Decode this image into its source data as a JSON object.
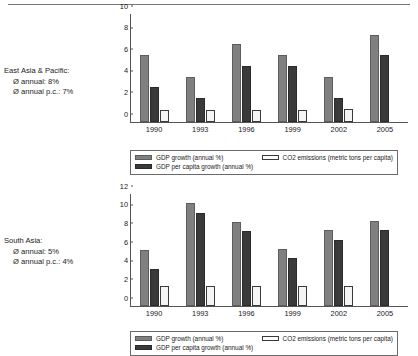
{
  "page": {
    "background": "#ffffff",
    "truncated_heading": ""
  },
  "colors": {
    "gdp_growth": "#808080",
    "gdp_per_capita_growth": "#3a3a3a",
    "co2_emissions": "#f4f4f4",
    "axis": "#555555",
    "text": "#1a1a1a"
  },
  "charts": [
    {
      "id": "east-asia-pacific",
      "caption": {
        "region": "East Asia & Pacific:",
        "annual": "Ø annual: 8%",
        "annual_pc": "Ø annual p.c.: 7%"
      },
      "yticks": [
        "10",
        "8",
        "6",
        "4",
        "2",
        "0"
      ],
      "xticks": [
        "1990",
        "1993",
        "1996",
        "1999",
        "2002",
        "2005"
      ],
      "legend": {
        "gdp_growth": "GDP growth (annual %)",
        "gdp_per_capita_growth": "GDP per capita growth (annual %)",
        "co2_emissions": "CO2 emissions (metric tons per capita)"
      },
      "chart_data": {
        "type": "bar",
        "title": "East Asia & Pacific",
        "xlabel": "",
        "ylabel": "",
        "ylim": [
          0,
          10
        ],
        "yticks": [
          0,
          2,
          4,
          6,
          8,
          10
        ],
        "grid": false,
        "legend_position": "bottom",
        "categories": [
          "1990",
          "1993",
          "1996",
          "1999",
          "2002",
          "2005"
        ],
        "series": [
          {
            "name": "GDP growth (annual %)",
            "values": [
              6.2,
              4.2,
              7.2,
              6.2,
              4.2,
              8.1
            ]
          },
          {
            "name": "GDP per capita growth (annual %)",
            "values": [
              3.2,
              2.2,
              5.2,
              5.2,
              2.2,
              6.2
            ]
          },
          {
            "name": "CO2 emissions (metric tons per capita)",
            "values": [
              1.1,
              1.1,
              1.1,
              1.1,
              1.2,
              null
            ]
          }
        ],
        "annotations": [
          "Ø annual: 8%",
          "Ø annual p.c.: 7%"
        ]
      }
    },
    {
      "id": "south-asia",
      "caption": {
        "region": "South Asia:",
        "annual": "Ø annual: 5%",
        "annual_pc": "Ø annual p.c.: 4%"
      },
      "yticks": [
        "12",
        "10",
        "8",
        "6",
        "4",
        "2",
        "0"
      ],
      "xticks": [
        "1990",
        "1993",
        "1996",
        "1999",
        "2002",
        "2005"
      ],
      "legend": {
        "gdp_growth": "GDP growth (annual %)",
        "gdp_per_capita_growth": "GDP per capita growth (annual %)",
        "co2_emissions": "CO2 emissions (metric tons per capita)"
      },
      "chart_data": {
        "type": "bar",
        "title": "South Asia",
        "xlabel": "",
        "ylabel": "",
        "ylim": [
          0,
          12
        ],
        "yticks": [
          0,
          2,
          4,
          6,
          8,
          10,
          12
        ],
        "grid": false,
        "legend_position": "bottom",
        "categories": [
          "1990",
          "1993",
          "1996",
          "1999",
          "2002",
          "2005"
        ],
        "series": [
          {
            "name": "GDP growth (annual %)",
            "values": [
              6.0,
              11.0,
              9.0,
              6.1,
              8.1,
              9.1
            ]
          },
          {
            "name": "GDP per capita growth (annual %)",
            "values": [
              4.0,
              10.0,
              8.0,
              5.1,
              7.1,
              8.1
            ]
          },
          {
            "name": "CO2 emissions (metric tons per capita)",
            "values": [
              2.1,
              2.1,
              2.1,
              2.1,
              2.1,
              null
            ]
          }
        ],
        "annotations": [
          "Ø annual: 5%",
          "Ø annual p.c.: 4%"
        ]
      }
    }
  ]
}
